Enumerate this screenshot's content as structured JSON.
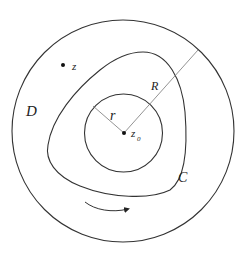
{
  "diagram": {
    "labels": {
      "domain": "D",
      "point_z": "z",
      "center": "z",
      "center_sub": "0",
      "inner_radius": "r",
      "outer_radius": "R",
      "contour": "C"
    },
    "colors": {
      "stroke": "#333333",
      "thin_stroke": "#777777",
      "background": "#ffffff"
    }
  }
}
